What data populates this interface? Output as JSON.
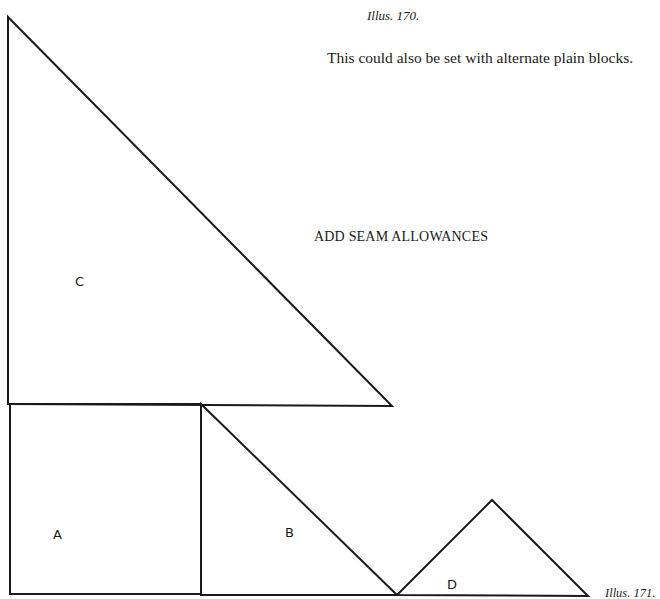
{
  "page": {
    "caption_top": "Illus. 170.",
    "note": "This could also be set with alternate plain blocks.",
    "instruction": "ADD SEAM ALLOWANCES",
    "caption_bottom": "Illus. 171."
  },
  "pattern_pieces": [
    {
      "label": "C",
      "shape": "right-triangle",
      "points": "8,17 8,404 392,406"
    },
    {
      "label": "A",
      "shape": "square",
      "points": "10,404 201,404 201,594 10,594"
    },
    {
      "label": "B",
      "shape": "right-triangle",
      "points": "201,404 397,595 201,595"
    },
    {
      "label": "D",
      "shape": "isosceles-triangle",
      "points": "397,595 492,500 588,596"
    }
  ],
  "colors": {
    "line": "#1a1a1a",
    "background": "#ffffff"
  }
}
